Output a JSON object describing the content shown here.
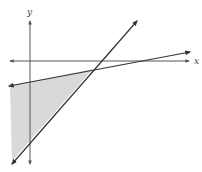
{
  "diagram": {
    "type": "linear-inequality-graph",
    "axes": {
      "x_label": "x",
      "y_label": "y",
      "origin_px": [
        30,
        61
      ]
    },
    "lines": [
      {
        "name": "steep-line",
        "from_px": [
          12,
          164
        ],
        "to_px": [
          137,
          21
        ],
        "arrows": "both"
      },
      {
        "name": "shallow-line",
        "from_px": [
          9,
          86
        ],
        "to_px": [
          190,
          52
        ],
        "arrows": "both"
      }
    ],
    "intersection_px": [
      93,
      69
    ],
    "shaded_region": {
      "description": "Triangular region below the shallow line and above/left of the steep line",
      "vertices_px": [
        [
          10,
          86
        ],
        [
          93,
          69
        ],
        [
          12,
          160
        ]
      ],
      "fill": "#d9d9d9"
    },
    "colors": {
      "line": "#333333",
      "axis": "#555555",
      "fill": "#d9d9d9",
      "background": "#ffffff"
    }
  }
}
